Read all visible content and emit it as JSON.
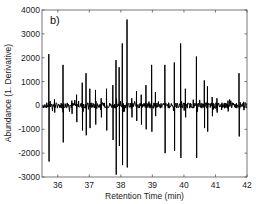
{
  "chart_data": {
    "type": "line",
    "panel_label": "b)",
    "title": "",
    "xlabel": "Retention Time (min)",
    "ylabel": "Abundance (1. Derivative)",
    "xlim": [
      35.5,
      42
    ],
    "ylim": [
      -3000,
      4000
    ],
    "xticks": [
      36,
      37,
      38,
      39,
      40,
      41,
      42
    ],
    "yticks": [
      -3000,
      -2000,
      -1000,
      0,
      1000,
      2000,
      3000,
      4000
    ],
    "xtick_labels": [
      "36",
      "37",
      "38",
      "39",
      "40",
      "41",
      "42"
    ],
    "ytick_labels": [
      "-3000",
      "-2000",
      "-1000",
      "0",
      "1000",
      "2000",
      "3000",
      "4000"
    ],
    "grid": false,
    "legend": null,
    "line_color": "#000000",
    "series": [
      {
        "name": "1st derivative signal",
        "peaks": [
          {
            "x": 35.72,
            "up": 2150,
            "down": -2350
          },
          {
            "x": 35.9,
            "up": 250,
            "down": -300
          },
          {
            "x": 36.17,
            "up": 1700,
            "down": -1550
          },
          {
            "x": 36.45,
            "up": 200,
            "down": -350
          },
          {
            "x": 36.6,
            "up": 450,
            "down": -700
          },
          {
            "x": 36.78,
            "up": 950,
            "down": -1050
          },
          {
            "x": 36.9,
            "up": 1350,
            "down": -1250
          },
          {
            "x": 37.02,
            "up": 700,
            "down": -950
          },
          {
            "x": 37.2,
            "up": 650,
            "down": -800
          },
          {
            "x": 37.38,
            "up": 300,
            "down": -500
          },
          {
            "x": 37.55,
            "up": 700,
            "down": -1050
          },
          {
            "x": 37.75,
            "up": 850,
            "down": -1450
          },
          {
            "x": 37.85,
            "up": 1900,
            "down": -2900
          },
          {
            "x": 37.95,
            "up": 1600,
            "down": -1700
          },
          {
            "x": 38.05,
            "up": 2600,
            "down": -2500
          },
          {
            "x": 38.2,
            "up": 3600,
            "down": -2600
          },
          {
            "x": 38.35,
            "up": 300,
            "down": -500
          },
          {
            "x": 38.5,
            "up": 600,
            "down": -650
          },
          {
            "x": 38.65,
            "up": 450,
            "down": -800
          },
          {
            "x": 38.8,
            "up": 850,
            "down": -1000
          },
          {
            "x": 38.98,
            "up": 1700,
            "down": -1100
          },
          {
            "x": 39.1,
            "up": 550,
            "down": -450
          },
          {
            "x": 39.4,
            "up": 1700,
            "down": -2000
          },
          {
            "x": 39.7,
            "up": 1800,
            "down": -1900
          },
          {
            "x": 39.9,
            "up": 2600,
            "down": -2200
          },
          {
            "x": 40.05,
            "up": 700,
            "down": -500
          },
          {
            "x": 40.4,
            "up": 2050,
            "down": -2200
          },
          {
            "x": 40.65,
            "up": 1050,
            "down": -950
          },
          {
            "x": 40.75,
            "up": 800,
            "down": -1100
          },
          {
            "x": 40.9,
            "up": 350,
            "down": -450
          },
          {
            "x": 41.05,
            "up": 300,
            "down": -300
          },
          {
            "x": 41.4,
            "up": 200,
            "down": -250
          },
          {
            "x": 41.75,
            "up": 1350,
            "down": -1300
          },
          {
            "x": 41.9,
            "up": 150,
            "down": -200
          }
        ],
        "baseline_noise": 120
      }
    ]
  }
}
